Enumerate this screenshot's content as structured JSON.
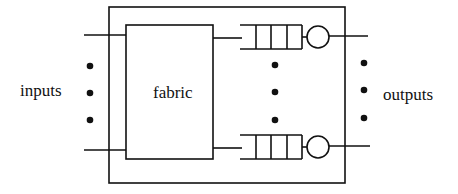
{
  "diagram": {
    "title": "",
    "labels": {
      "inputs": "inputs",
      "fabric": "fabric",
      "outputs": "outputs"
    },
    "components": {
      "outer_box": "switch",
      "fabric_box": "fabric",
      "output_queues": [
        {
          "position": "top",
          "slots": 4,
          "server": "circle"
        },
        {
          "position": "bottom",
          "slots": 4,
          "server": "circle"
        }
      ]
    },
    "ellipsis_dots": {
      "inputs": 3,
      "queues": 3,
      "outputs": 3
    },
    "colors": {
      "stroke": "#111111",
      "background": "#ffffff"
    }
  }
}
